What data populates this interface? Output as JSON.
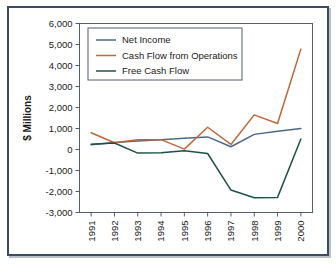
{
  "figure": {
    "background_color": "#ffffff",
    "frame_color": "#3c4a63",
    "plot_border_color": "#555e6e"
  },
  "chart_data": {
    "type": "line",
    "title": "",
    "xlabel": "",
    "ylabel": "$ Millions",
    "x": [
      "1991",
      "1992",
      "1993",
      "1994",
      "1995",
      "1996",
      "1997",
      "1998",
      "1999",
      "2000"
    ],
    "categories": [
      "1991",
      "1992",
      "1993",
      "1994",
      "1995",
      "1996",
      "1997",
      "1998",
      "1999",
      "2000"
    ],
    "ylim": [
      -3000,
      6000
    ],
    "ytick_values": [
      6000,
      5000,
      4000,
      3000,
      2000,
      1000,
      0,
      -1000,
      -2000,
      -3000
    ],
    "ytick_labels": [
      "6,000",
      "5,000",
      "4,000",
      "3,000",
      "2,000",
      "1,000",
      "0",
      "-1,000",
      "-2,000",
      "-3,000"
    ],
    "grid": false,
    "legend_position": "upper-left-inside",
    "series": [
      {
        "name": "Net Income",
        "color": "#4a6a8a",
        "values": [
          230,
          330,
          400,
          460,
          540,
          600,
          130,
          720,
          870,
          1000
        ]
      },
      {
        "name": "Cash Flow from Operations",
        "color": "#c0663a",
        "values": [
          800,
          320,
          460,
          470,
          20,
          1060,
          240,
          1650,
          1240,
          4780
        ]
      },
      {
        "name": "Free Cash Flow",
        "color": "#1e5248",
        "values": [
          250,
          310,
          -170,
          -150,
          -60,
          -190,
          -1930,
          -2300,
          -2280,
          500
        ]
      }
    ]
  },
  "legend": {
    "items": [
      {
        "label": "Net Income",
        "color": "#4a6a8a"
      },
      {
        "label": "Cash Flow from Operations",
        "color": "#c0663a"
      },
      {
        "label": "Free Cash Flow",
        "color": "#1e5248"
      }
    ]
  },
  "axes": {
    "y_axis_title": "$ Millions",
    "y_tick_labels": [
      "6,000",
      "5,000",
      "4,000",
      "3,000",
      "2,000",
      "1,000",
      "0",
      "-1,000",
      "-2,000",
      "-3,000"
    ],
    "x_tick_labels": [
      "1991",
      "1992",
      "1993",
      "1994",
      "1995",
      "1996",
      "1997",
      "1998",
      "1999",
      "2000"
    ]
  }
}
